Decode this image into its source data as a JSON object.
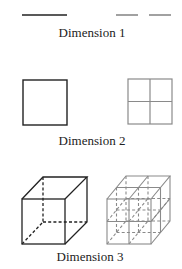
{
  "colors": {
    "whole": "#222222",
    "parts": "#8a8a8a",
    "background": "#ffffff"
  },
  "rows": [
    {
      "label": "Dimension 1",
      "whole_shape": "line-segment",
      "divided_shape": "line-segment-split-in-2"
    },
    {
      "label": "Dimension 2",
      "whole_shape": "square",
      "divided_shape": "square-split-in-4"
    },
    {
      "label": "Dimension 3",
      "whole_shape": "cube",
      "divided_shape": "cube-split-in-8"
    }
  ]
}
